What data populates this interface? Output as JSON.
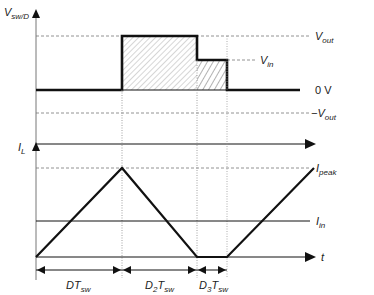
{
  "top_plot": {
    "y_axis_label": "V",
    "y_axis_label_sub": "sw/D",
    "levels": [
      {
        "name": "V",
        "sub": "out",
        "y": 36
      },
      {
        "name": "V",
        "sub": "in",
        "y": 60
      },
      {
        "name": "0 V",
        "sub": "",
        "y": 90
      },
      {
        "name": "−V",
        "sub": "out",
        "y": 113
      }
    ],
    "labels": {
      "vout_main": "V",
      "vout_sub": "out",
      "vin_main": "V",
      "vin_sub": "in",
      "zero": "0 V",
      "neg_vout_main": "−V",
      "neg_vout_sub": "out"
    }
  },
  "bottom_plot": {
    "y_axis_label": "I",
    "y_axis_label_sub": "L",
    "x_axis_label": "t",
    "labels": {
      "ipeak_main": "I",
      "ipeak_sub": "peak",
      "iin_main": "I",
      "iin_sub": "in"
    }
  },
  "intervals": [
    {
      "main": "DT",
      "sub": "sw"
    },
    {
      "main": "D",
      "sub2": "2",
      "tail": "T",
      "sub": "sw"
    },
    {
      "main": "D",
      "sub2": "3",
      "tail": "T",
      "sub": "sw"
    }
  ],
  "intervals_text": {
    "i0_main": "DT",
    "i0_sub": "sw",
    "i1_main": "D",
    "i1_num": "2",
    "i1_tail": "T",
    "i1_sub": "sw",
    "i2_main": "D",
    "i2_num": "3",
    "i2_tail": "T",
    "i2_sub": "sw"
  },
  "colors": {
    "line": "#111111",
    "dash": "#777777",
    "hatch": "#888888"
  }
}
